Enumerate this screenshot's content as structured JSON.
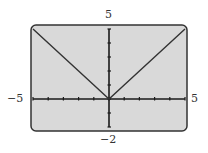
{
  "chart_data": {
    "type": "line",
    "title": "",
    "xlabel": "",
    "ylabel": "",
    "xlim": [
      -5,
      5
    ],
    "ylim": [
      -2,
      5
    ],
    "grid": false,
    "legend": null,
    "x_ticks": [
      -5,
      -4,
      -3,
      -2,
      -1,
      0,
      1,
      2,
      3,
      4,
      5
    ],
    "y_ticks": [
      -2,
      -1,
      0,
      1,
      2,
      3,
      4,
      5
    ],
    "series": [
      {
        "name": "y = |x|",
        "x": [
          -5,
          -4,
          -3,
          -2,
          -1,
          0,
          1,
          2,
          3,
          4,
          5
        ],
        "y": [
          5,
          4,
          3,
          2,
          1,
          0,
          1,
          2,
          3,
          4,
          5
        ]
      }
    ],
    "labels": {
      "ymax": "5",
      "ymin": "−2",
      "xmin": "−5",
      "xmax": "5"
    }
  },
  "colors": {
    "screen_bg": "#d9d9d9",
    "frame": "#333333",
    "axis": "#1a1a1a",
    "curve": "#333333"
  }
}
